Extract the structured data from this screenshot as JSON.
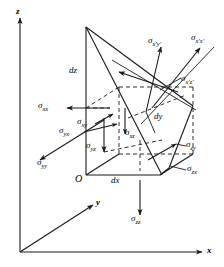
{
  "figure": {
    "type": "stress-tetrahedron-diagram",
    "stroke_color": "#1a1a1a",
    "background_color": "#ffffff"
  },
  "axes": {
    "x": "x",
    "y": "y",
    "z": "z",
    "origin": "O"
  },
  "dimensions": {
    "dx": "dx",
    "dy": "dy",
    "dz": "dz"
  },
  "stresses": {
    "cartesian": [
      {
        "id": "sigma-xx",
        "base": "σ",
        "sub": "xx"
      },
      {
        "id": "sigma-xy",
        "base": "σ",
        "sub": "xy"
      },
      {
        "id": "sigma-xz",
        "base": "σ",
        "sub": "xz"
      },
      {
        "id": "sigma-yx",
        "base": "σ",
        "sub": "yx"
      },
      {
        "id": "sigma-yy",
        "base": "σ",
        "sub": "yy"
      },
      {
        "id": "sigma-yz",
        "base": "σ",
        "sub": "yz"
      },
      {
        "id": "sigma-zx",
        "base": "σ",
        "sub": "zx"
      },
      {
        "id": "sigma-zy",
        "base": "σ",
        "sub": "zy"
      },
      {
        "id": "sigma-zz",
        "base": "σ",
        "sub": "zz"
      }
    ],
    "rotated": [
      {
        "id": "sigma-xpxp",
        "base": "σ",
        "sub": "x′x′"
      },
      {
        "id": "sigma-xpyp",
        "base": "σ",
        "sub": "x′y′"
      },
      {
        "id": "sigma-xpzp",
        "base": "σ",
        "sub": "x′z′"
      }
    ]
  },
  "labels": {
    "sigma_xx": {
      "base": "σ",
      "sub": "xx"
    },
    "sigma_xy": {
      "base": "σ",
      "sub": "xy"
    },
    "sigma_xz": {
      "base": "σ",
      "sub": "xz"
    },
    "sigma_yx": {
      "base": "σ",
      "sub": "yx"
    },
    "sigma_yy": {
      "base": "σ",
      "sub": "yy"
    },
    "sigma_yz": {
      "base": "σ",
      "sub": "yz"
    },
    "sigma_zx": {
      "base": "σ",
      "sub": "zx"
    },
    "sigma_zy": {
      "base": "σ",
      "sub": "zy"
    },
    "sigma_zz": {
      "base": "σ",
      "sub": "zz"
    },
    "sigma_xpxp": {
      "base": "σ",
      "sub": "x′x′"
    },
    "sigma_xpyp": {
      "base": "σ",
      "sub": "x′y′"
    },
    "sigma_xpzp": {
      "base": "σ",
      "sub": "x′z′"
    }
  }
}
